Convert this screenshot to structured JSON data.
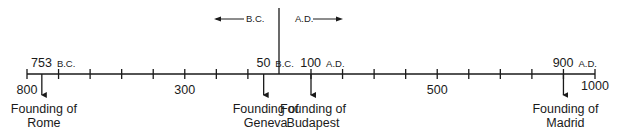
{
  "timeline": {
    "range": [
      -800,
      1000
    ],
    "tick_interval": 100,
    "divider_year": 0,
    "direction_labels": {
      "bc": "B.C.",
      "ad": "A.D."
    },
    "axis_labels": [
      {
        "year": -800,
        "text": "800"
      },
      {
        "year": -300,
        "text": "300"
      },
      {
        "year": 500,
        "text": "500"
      },
      {
        "year": 1000,
        "text": "1000"
      }
    ],
    "events": [
      {
        "year": -753,
        "number": "753",
        "era": "B.C.",
        "caption_line1": "Founding of",
        "caption_line2": "Rome"
      },
      {
        "year": -50,
        "number": "50",
        "era": "B.C.",
        "caption_line1": "Founding of",
        "caption_line2": "Geneva"
      },
      {
        "year": 100,
        "number": "100",
        "era": "A.D.",
        "caption_line1": "Founding of",
        "caption_line2": "Budapest"
      },
      {
        "year": 900,
        "number": "900",
        "era": "A.D.",
        "caption_line1": "Founding of",
        "caption_line2": "Madrid"
      }
    ],
    "line_color": "#1a1a1a"
  }
}
